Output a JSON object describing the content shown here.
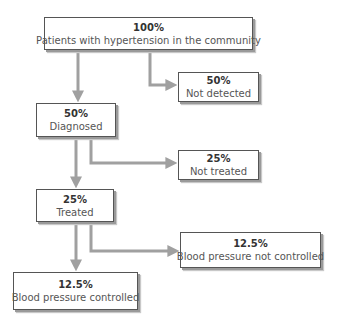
{
  "diagram": {
    "type": "flowchart",
    "colors": {
      "connector": "#a0a0a0",
      "box_border": "#555555",
      "box_shadow": "#9a9a9a",
      "text": "#3a3a3a"
    },
    "nodes": [
      {
        "id": "community",
        "percent": "100%",
        "label": "Patients with hypertension in the community"
      },
      {
        "id": "not-detected",
        "percent": "50%",
        "label": "Not detected"
      },
      {
        "id": "diagnosed",
        "percent": "50%",
        "label": "Diagnosed"
      },
      {
        "id": "not-treated",
        "percent": "25%",
        "label": "Not treated"
      },
      {
        "id": "treated",
        "percent": "25%",
        "label": "Treated"
      },
      {
        "id": "bp-not-controlled",
        "percent": "12.5%",
        "label": "Blood pressure not controlled"
      },
      {
        "id": "bp-controlled",
        "percent": "12.5%",
        "label": "Blood pressure controlled"
      }
    ],
    "edges": [
      {
        "from": "community",
        "to": "diagnosed"
      },
      {
        "from": "community",
        "to": "not-detected"
      },
      {
        "from": "diagnosed",
        "to": "treated"
      },
      {
        "from": "diagnosed",
        "to": "not-treated"
      },
      {
        "from": "treated",
        "to": "bp-controlled"
      },
      {
        "from": "treated",
        "to": "bp-not-controlled"
      }
    ]
  }
}
